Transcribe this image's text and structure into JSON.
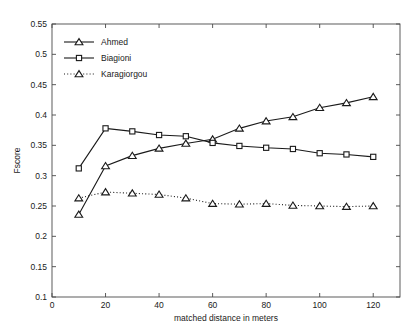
{
  "chart_data": {
    "type": "line",
    "title": "",
    "xlabel": "matched distance in meters",
    "ylabel": "Fscore",
    "xlim": [
      0,
      130
    ],
    "ylim": [
      0.1,
      0.55
    ],
    "grid": false,
    "legend_position": "top-left",
    "xticks": [
      0,
      20,
      40,
      60,
      80,
      100,
      120
    ],
    "xtick_labels": [
      "0",
      "20",
      "40",
      "60",
      "80",
      "100",
      "120"
    ],
    "yticks": [
      0.1,
      0.15,
      0.2,
      0.25,
      0.3,
      0.35,
      0.4,
      0.45,
      0.5,
      0.55
    ],
    "ytick_labels": [
      "0.1",
      "0.15",
      "0.2",
      "0.25",
      "0.3",
      "0.35",
      "0.4",
      "0.45",
      "0.5",
      "0.55"
    ],
    "x": [
      10,
      20,
      30,
      40,
      50,
      60,
      70,
      80,
      90,
      100,
      110,
      120
    ],
    "series": [
      {
        "name": "Ahmed",
        "marker": "triangle",
        "linestyle": "solid",
        "color": "#1a1a1a",
        "values": [
          0.236,
          0.316,
          0.333,
          0.345,
          0.353,
          0.36,
          0.378,
          0.39,
          0.397,
          0.412,
          0.42,
          0.43
        ]
      },
      {
        "name": "Biagioni",
        "marker": "square",
        "linestyle": "solid",
        "color": "#1a1a1a",
        "values": [
          0.312,
          0.378,
          0.373,
          0.367,
          0.365,
          0.354,
          0.349,
          0.346,
          0.344,
          0.337,
          0.335,
          0.331
        ]
      },
      {
        "name": "Karagiorgou",
        "marker": "triangle",
        "linestyle": "dotted",
        "color": "#1a1a1a",
        "values": [
          0.263,
          0.273,
          0.271,
          0.269,
          0.263,
          0.254,
          0.253,
          0.254,
          0.251,
          0.25,
          0.249,
          0.25
        ]
      }
    ]
  },
  "legend": {
    "entries": [
      {
        "label": "Ahmed"
      },
      {
        "label": "Biagioni"
      },
      {
        "label": "Karagiorgou"
      }
    ]
  }
}
